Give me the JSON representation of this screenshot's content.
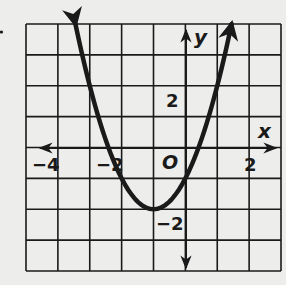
{
  "chart_data": {
    "type": "line",
    "title": "",
    "xlabel": "x",
    "ylabel": "y",
    "origin_label": "O",
    "xlim": [
      -5,
      3
    ],
    "ylim": [
      -4,
      4
    ],
    "grid": true,
    "x_tick_labels": [
      {
        "value": -4,
        "label": "−4"
      },
      {
        "value": -2,
        "label": "−2"
      },
      {
        "value": 2,
        "label": "2"
      }
    ],
    "y_tick_labels": [
      {
        "value": 2,
        "label": "2"
      },
      {
        "value": -2,
        "label": "−2"
      }
    ],
    "series": [
      {
        "name": "parabola",
        "equation": "y = (x + 1)^2 - 2",
        "vertex": [
          -1,
          -2
        ],
        "x_intercepts": [
          -2.41,
          0.41
        ],
        "y_intercept": -1,
        "arrows_at_ends": true,
        "x": [
          -3.45,
          -3,
          -2.5,
          -2,
          -1.5,
          -1,
          -0.5,
          0,
          0.5,
          1,
          1.45
        ],
        "y": [
          4,
          2,
          0.25,
          -1,
          -1.75,
          -2,
          -1.75,
          -1,
          0.25,
          2,
          4
        ]
      }
    ],
    "legend": null
  },
  "labels": {
    "x_axis": "x",
    "y_axis": "y",
    "origin": "O",
    "xtick_neg4": "−4",
    "xtick_neg2": "−2",
    "xtick_2": "2",
    "ytick_2": "2",
    "ytick_neg2": "−2"
  },
  "colors": {
    "background": "#ededeb",
    "ink": "#1a1a1a"
  }
}
